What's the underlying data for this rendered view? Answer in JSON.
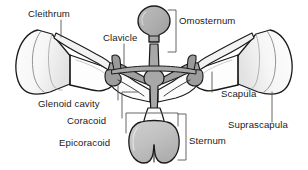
{
  "figure": {
    "kind": "anatomical-diagram",
    "background_color": "#ffffff",
    "outline_color": "#1a1a1a",
    "label_color": "#1a1a1a",
    "leader_color": "#555555",
    "fills": {
      "bone_light": "#fefefe",
      "bone_shade": "#e6e6e6",
      "bone_shade_2": "#d5d5d5",
      "cartilage_gray": "#a8a8a8",
      "cartilage_gray_dark": "#8f8f8f",
      "sternum_gray": "#c2c2c2"
    },
    "labels": [
      {
        "id": "cleithrum",
        "text": "Cleithrum",
        "x": 28,
        "y": 17,
        "align": "start"
      },
      {
        "id": "clavicle",
        "text": "Clavicle",
        "x": 103,
        "y": 41,
        "align": "start"
      },
      {
        "id": "omosternum",
        "text": "Omosternum",
        "x": 178,
        "y": 24,
        "align": "start"
      },
      {
        "id": "glenoid-cavity",
        "text": "Glenoid cavity",
        "x": 40,
        "y": 106,
        "align": "start"
      },
      {
        "id": "coracoid",
        "text": "Coracoid",
        "x": 66,
        "y": 124,
        "align": "start"
      },
      {
        "id": "epicoracoid",
        "text": "Epicoracoid",
        "x": 60,
        "y": 145,
        "align": "start"
      },
      {
        "id": "scapula",
        "text": "Scapula",
        "x": 222,
        "y": 97,
        "align": "start"
      },
      {
        "id": "suprascapula",
        "text": "Suprascapula",
        "x": 228,
        "y": 127,
        "align": "start"
      },
      {
        "id": "sternum",
        "text": "Sternum",
        "x": 188,
        "y": 144,
        "align": "start"
      }
    ]
  }
}
